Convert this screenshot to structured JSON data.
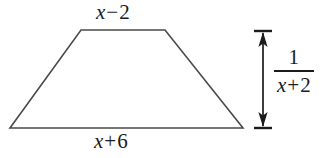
{
  "figure": {
    "type": "geometry-diagram",
    "shape": "trapezoid",
    "background_color": "#ffffff",
    "stroke_color": "#4a4a4a",
    "text_color": "#1b1b1b",
    "canvas": {
      "width": 334,
      "height": 158
    },
    "vertices": {
      "top_left": [
        81,
        30
      ],
      "top_right": [
        165,
        30
      ],
      "bottom_right": [
        243,
        128
      ],
      "bottom_left": [
        10,
        128
      ]
    },
    "dimension_arrow": {
      "x": 263,
      "y_top": 31,
      "y_bottom": 128,
      "cap_half_width": 9,
      "double_headed": true
    }
  },
  "labels": {
    "top_side": {
      "name": "top-side-label",
      "variable": "x",
      "operator": "−",
      "constant": "2",
      "full": "x − 2"
    },
    "bottom_side": {
      "name": "bottom-side-label",
      "variable": "x",
      "operator": "+",
      "constant": "6",
      "full": "x + 6"
    },
    "height": {
      "name": "height-label",
      "numerator": "1",
      "denominator_variable": "x",
      "denominator_operator": "+",
      "denominator_constant": "2",
      "full": "1 / (x + 2)"
    }
  }
}
